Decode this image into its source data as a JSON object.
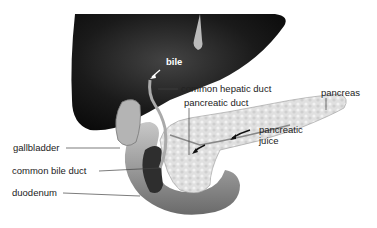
{
  "figure": {
    "labels": {
      "bile": "bile",
      "common_hepatic_duct": "common hepatic duct",
      "pancreatic_duct": "pancreatic duct",
      "pancreas": "pancreas",
      "pancreatic_juice_1": "pancreatic",
      "pancreatic_juice_2": "juice",
      "gallbladder": "gallbladder",
      "common_bile_duct": "common bile duct",
      "duodenum": "duodenum"
    },
    "colors": {
      "liver": "#1c1c1c",
      "organ_light": "#d8d8d8",
      "organ_mid": "#a8a8a8",
      "organ_dark": "#3a3a3a",
      "leader_line": "#444444"
    }
  }
}
